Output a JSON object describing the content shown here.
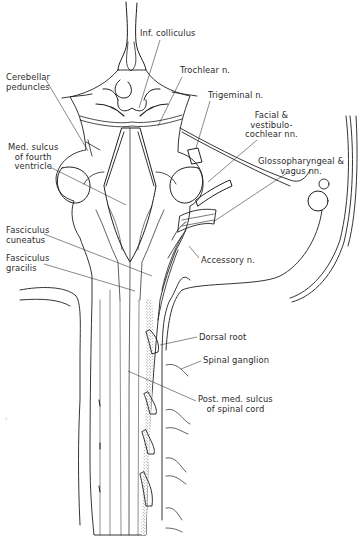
{
  "figure": {
    "colors": {
      "ink": "#1e1e1e",
      "label": "#2b2b2b",
      "stipple": "#5a5a5a",
      "background": "#ffffff"
    }
  },
  "labels": [
    {
      "id": "inf-colliculus",
      "text": "Inf. colliculus",
      "x": 140,
      "y": 29,
      "align": "left",
      "leader": [
        [
          160,
          40
        ],
        [
          139,
          108
        ]
      ]
    },
    {
      "id": "trochlear-n",
      "text": "Trochlear n.",
      "x": 180,
      "y": 66,
      "align": "left",
      "leader": [
        [
          182,
          77
        ],
        [
          158,
          126
        ]
      ]
    },
    {
      "id": "cerebellar-peduncles",
      "text": "Cerebellar\npeduncles",
      "x": 6,
      "y": 73,
      "align": "left",
      "leader": [
        [
          46,
          80
        ],
        [
          88,
          151
        ]
      ]
    },
    {
      "id": "trigeminal-n",
      "text": "Trigeminal n.",
      "x": 208,
      "y": 91,
      "align": "left",
      "leader": [
        [
          210,
          101
        ],
        [
          196,
          148
        ]
      ]
    },
    {
      "id": "facial-vestibulocochlear-nn",
      "text": "Facial &\nvestibulo-\ncochlear nn.",
      "x": 245,
      "y": 111,
      "align": "center",
      "leader": [
        [
          257,
          140
        ],
        [
          208,
          182
        ]
      ]
    },
    {
      "id": "med-sulcus-fourth-ventricle",
      "text": "Med. sulcus\nof fourth\nventricle",
      "x": 8,
      "y": 143,
      "align": "center",
      "leader": [
        [
          50,
          167
        ],
        [
          126,
          205
        ]
      ]
    },
    {
      "id": "glossopharyngeal-vagus-nn",
      "text": "Glossopharyngeal &\nvagus nn.",
      "x": 258,
      "y": 157,
      "align": "center",
      "leader": [
        [
          287,
          173
        ],
        [
          213,
          222
        ]
      ]
    },
    {
      "id": "fasciculus-cuneatus",
      "text": "Fasciculus\ncuneatus",
      "x": 6,
      "y": 226,
      "align": "left",
      "leader": [
        [
          44,
          234
        ],
        [
          152,
          276
        ]
      ]
    },
    {
      "id": "accessory-n",
      "text": "Accessory n.",
      "x": 201,
      "y": 256,
      "align": "left",
      "leader": [
        [
          199,
          258
        ],
        [
          189,
          246
        ]
      ]
    },
    {
      "id": "fasciculus-gracilis",
      "text": "Fasciculus\ngracilis",
      "x": 6,
      "y": 254,
      "align": "left",
      "leader": [
        [
          44,
          264
        ],
        [
          135,
          291
        ]
      ]
    },
    {
      "id": "dorsal-root",
      "text": "Dorsal root",
      "x": 199,
      "y": 333,
      "align": "left",
      "leader": [
        [
          197,
          337
        ],
        [
          160,
          345
        ]
      ]
    },
    {
      "id": "spinal-ganglion",
      "text": "Spinal ganglion",
      "x": 203,
      "y": 356,
      "align": "left",
      "leader": [
        [
          201,
          361
        ],
        [
          181,
          369
        ]
      ]
    },
    {
      "id": "post-med-sulcus-spinal-cord",
      "text": "Post. med. sulcus\nof spinal cord",
      "x": 198,
      "y": 395,
      "align": "center",
      "leader": [
        [
          196,
          401
        ],
        [
          128,
          371
        ]
      ]
    }
  ],
  "stray_mark": {
    "x": 5,
    "y": 412,
    "text": ","
  }
}
